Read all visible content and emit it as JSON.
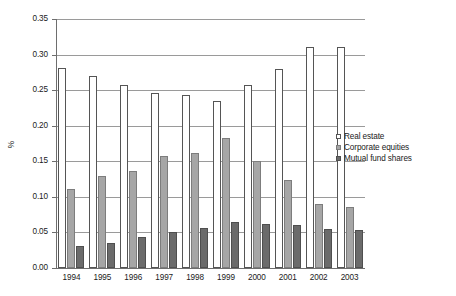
{
  "chart_data": {
    "type": "bar",
    "title": "",
    "subtitle": "",
    "xlabel": "",
    "ylabel": "%",
    "ylim": [
      0.0,
      0.35
    ],
    "ytick_labels": [
      "0.00",
      "0.05",
      "0.10",
      "0.15",
      "0.20",
      "0.25",
      "0.30",
      "0.35"
    ],
    "ytick_values": [
      0.0,
      0.05,
      0.1,
      0.15,
      0.2,
      0.25,
      0.3,
      0.35
    ],
    "grid": "horizontal",
    "legend_position": "right-middle",
    "categories": [
      "1994",
      "1995",
      "1996",
      "1997",
      "1998",
      "1999",
      "2000",
      "2001",
      "2002",
      "2003"
    ],
    "series": [
      {
        "name": "Real estate",
        "color": "#ffffff",
        "edge_color": "#555555",
        "values": [
          0.281,
          0.27,
          0.257,
          0.246,
          0.243,
          0.235,
          0.257,
          0.28,
          0.31,
          0.311
        ]
      },
      {
        "name": "Corporate equities",
        "color": "#a6a6a6",
        "edge_color": "#7d7d7d",
        "values": [
          0.111,
          0.13,
          0.137,
          0.157,
          0.161,
          0.183,
          0.15,
          0.124,
          0.09,
          0.086
        ]
      },
      {
        "name": "Mutual fund shares",
        "color": "#6b6b6b",
        "edge_color": "#4f4f4f",
        "values": [
          0.031,
          0.035,
          0.043,
          0.05,
          0.056,
          0.065,
          0.062,
          0.06,
          0.055,
          0.054
        ]
      }
    ]
  },
  "legend": {
    "items": [
      {
        "label": "Real estate"
      },
      {
        "label": "Corporate equities"
      },
      {
        "label": "Mutual fund shares"
      }
    ]
  }
}
